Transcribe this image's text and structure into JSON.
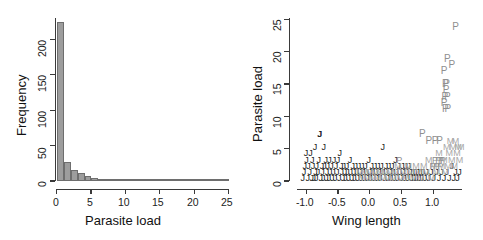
{
  "figure": {
    "title": "",
    "panels": [
      "histogram",
      "scatterplot"
    ]
  },
  "colors": {
    "bar_fill": "#9d9d9d",
    "bar_border": "#6e6e6e",
    "axis": "#3a3a3a",
    "text": "#111111",
    "group_J": "#1a1a1a",
    "group_M": "#a8a8a8",
    "group_P": "#8f8f8f"
  },
  "chart_data": [
    {
      "type": "bar",
      "id": "histogram",
      "title": "",
      "xlabel": "Parasite load",
      "ylabel": "Frequency",
      "xlim": [
        0,
        25
      ],
      "ylim": [
        0,
        230
      ],
      "xticks": [
        "0",
        "5",
        "10",
        "15",
        "20",
        "25"
      ],
      "xtick_values": [
        0,
        5,
        10,
        15,
        20,
        25
      ],
      "yticks": [
        "0",
        "50",
        "100",
        "150",
        "200"
      ],
      "ytick_values": [
        0,
        50,
        100,
        150,
        200
      ],
      "grid": false,
      "legend": "none",
      "bin_width": 1,
      "bin_starts": [
        0,
        1,
        2,
        3,
        4,
        5,
        6,
        7,
        8,
        9,
        10,
        11,
        12,
        13,
        14,
        15,
        16,
        17,
        18,
        19,
        20,
        21,
        22,
        23,
        24
      ],
      "categories": [
        "0-1",
        "1-2",
        "2-3",
        "3-4",
        "4-5",
        "5-6",
        "6-7",
        "7-8",
        "8-9",
        "9-10",
        "10-11",
        "11-12",
        "12-13",
        "13-14",
        "14-15",
        "15-16",
        "16-17",
        "17-18",
        "18-19",
        "19-20",
        "20-21",
        "21-22",
        "22-23",
        "23-24",
        "24-25"
      ],
      "values": [
        224,
        27,
        16,
        11,
        7,
        4,
        3,
        2,
        2,
        1,
        2,
        1,
        2,
        2,
        1,
        1,
        1,
        0,
        0,
        1,
        0,
        0,
        0,
        0,
        1
      ]
    },
    {
      "type": "scatter",
      "id": "scatterplot",
      "title": "",
      "xlabel": "Wing length",
      "ylabel": "Parasite load",
      "xlim": [
        -1.3,
        1.28
      ],
      "ylim": [
        -0.4,
        25.5
      ],
      "xticks": [
        "-1.0",
        "-0.5",
        "0.0",
        "0.5",
        "1.0"
      ],
      "xtick_values": [
        -1.0,
        -0.5,
        0.0,
        0.5,
        1.0
      ],
      "yticks": [
        "0",
        "5",
        "10",
        "15",
        "20",
        "25"
      ],
      "ytick_values": [
        0,
        5,
        10,
        15,
        20,
        25
      ],
      "grid": false,
      "legend": "none",
      "marker_type": "text-letter",
      "series": [
        {
          "name": "J",
          "label": "J",
          "color": "#1a1a1a",
          "points": [
            [
              -1.21,
              0
            ],
            [
              -1.19,
              1
            ],
            [
              -1.18,
              2
            ],
            [
              -1.16,
              4
            ],
            [
              -1.15,
              3
            ],
            [
              -1.13,
              0
            ],
            [
              -1.12,
              2
            ],
            [
              -1.1,
              1
            ],
            [
              -1.09,
              4
            ],
            [
              -1.07,
              0
            ],
            [
              -1.06,
              3
            ],
            [
              -1.05,
              2
            ],
            [
              -1.04,
              0
            ],
            [
              -1.02,
              5
            ],
            [
              -1.01,
              1
            ],
            [
              -1.0,
              0
            ],
            [
              -0.99,
              2
            ],
            [
              -0.97,
              1
            ],
            [
              -0.96,
              3
            ],
            [
              -0.95,
              7
            ],
            [
              -0.94,
              7
            ],
            [
              -0.93,
              0
            ],
            [
              -0.91,
              2
            ],
            [
              -0.9,
              1
            ],
            [
              -0.89,
              0
            ],
            [
              -0.88,
              5
            ],
            [
              -0.87,
              2
            ],
            [
              -0.85,
              3
            ],
            [
              -0.84,
              0
            ],
            [
              -0.83,
              1
            ],
            [
              -0.82,
              2
            ],
            [
              -0.8,
              0
            ],
            [
              -0.79,
              3
            ],
            [
              -0.78,
              1
            ],
            [
              -0.76,
              2
            ],
            [
              -0.75,
              0
            ],
            [
              -0.73,
              1
            ],
            [
              -0.72,
              3
            ],
            [
              -0.7,
              0
            ],
            [
              -0.69,
              2
            ],
            [
              -0.67,
              1
            ],
            [
              -0.66,
              3
            ],
            [
              -0.64,
              0
            ],
            [
              -0.63,
              4
            ],
            [
              -0.61,
              2
            ],
            [
              -0.6,
              1
            ],
            [
              -0.58,
              0
            ],
            [
              -0.57,
              2
            ],
            [
              -0.55,
              1
            ],
            [
              -0.54,
              0
            ],
            [
              -0.52,
              2
            ],
            [
              -0.51,
              1
            ],
            [
              -0.49,
              0
            ],
            [
              -0.47,
              3
            ],
            [
              -0.46,
              1
            ],
            [
              -0.44,
              0
            ],
            [
              -0.43,
              2
            ],
            [
              -0.41,
              1
            ],
            [
              -0.4,
              0
            ],
            [
              -0.38,
              2
            ],
            [
              -0.36,
              1
            ],
            [
              -0.35,
              0
            ],
            [
              -0.33,
              2
            ],
            [
              -0.31,
              1
            ],
            [
              -0.3,
              0
            ],
            [
              -0.28,
              2
            ],
            [
              -0.26,
              1
            ],
            [
              -0.25,
              0
            ],
            [
              -0.23,
              2
            ],
            [
              -0.21,
              1
            ],
            [
              -0.2,
              0
            ],
            [
              -0.18,
              3
            ],
            [
              -0.16,
              1
            ],
            [
              -0.15,
              0
            ],
            [
              -0.13,
              2
            ],
            [
              -0.11,
              1
            ],
            [
              -0.1,
              0
            ],
            [
              -0.08,
              2
            ],
            [
              -0.06,
              1
            ],
            [
              -0.05,
              0
            ],
            [
              -0.03,
              2
            ],
            [
              -0.01,
              1
            ],
            [
              0.0,
              0
            ],
            [
              0.02,
              2
            ],
            [
              0.04,
              5
            ],
            [
              0.05,
              1
            ],
            [
              0.07,
              0
            ],
            [
              0.09,
              2
            ],
            [
              0.1,
              1
            ],
            [
              0.12,
              0
            ],
            [
              0.14,
              2
            ],
            [
              0.16,
              1
            ],
            [
              0.17,
              0
            ],
            [
              0.19,
              2
            ],
            [
              0.21,
              1
            ],
            [
              0.22,
              0
            ],
            [
              0.24,
              3
            ],
            [
              0.26,
              1
            ],
            [
              0.27,
              0
            ],
            [
              0.29,
              2
            ],
            [
              0.31,
              1
            ],
            [
              0.33,
              0
            ],
            [
              0.35,
              2
            ],
            [
              0.36,
              1
            ],
            [
              0.38,
              0
            ],
            [
              0.4,
              2
            ],
            [
              0.42,
              1
            ],
            [
              0.43,
              0
            ],
            [
              0.45,
              2
            ],
            [
              0.47,
              1
            ],
            [
              0.49,
              0
            ],
            [
              0.51,
              1
            ],
            [
              0.53,
              0
            ],
            [
              0.55,
              1
            ],
            [
              0.57,
              0
            ],
            [
              0.59,
              1
            ],
            [
              0.61,
              0
            ],
            [
              0.63,
              1
            ],
            [
              0.65,
              0
            ],
            [
              0.67,
              1
            ],
            [
              0.7,
              0
            ],
            [
              0.73,
              1
            ],
            [
              0.76,
              0
            ],
            [
              0.8,
              1
            ],
            [
              0.84,
              0
            ],
            [
              0.88,
              1
            ],
            [
              0.92,
              0
            ],
            [
              0.96,
              1
            ],
            [
              1.0,
              0
            ],
            [
              1.04,
              1
            ],
            [
              1.08,
              0
            ],
            [
              1.12,
              2
            ],
            [
              1.15,
              0
            ],
            [
              1.18,
              1
            ],
            [
              1.21,
              0
            ],
            [
              1.24,
              1
            ]
          ]
        },
        {
          "name": "M",
          "label": "M",
          "color": "#a8a8a8",
          "points": [
            [
              -0.32,
              1
            ],
            [
              -0.28,
              0
            ],
            [
              -0.24,
              1
            ],
            [
              -0.2,
              0
            ],
            [
              -0.16,
              1
            ],
            [
              -0.12,
              0
            ],
            [
              -0.08,
              1
            ],
            [
              -0.04,
              0
            ],
            [
              0.0,
              1
            ],
            [
              0.04,
              0
            ],
            [
              0.08,
              1
            ],
            [
              0.12,
              0
            ],
            [
              0.16,
              1
            ],
            [
              0.2,
              0
            ],
            [
              0.24,
              1
            ],
            [
              0.28,
              2
            ],
            [
              0.32,
              0
            ],
            [
              0.36,
              1
            ],
            [
              0.4,
              0
            ],
            [
              0.44,
              2
            ],
            [
              0.48,
              1
            ],
            [
              0.52,
              0
            ],
            [
              0.56,
              2
            ],
            [
              0.6,
              1
            ],
            [
              0.64,
              0
            ],
            [
              0.68,
              2
            ],
            [
              0.72,
              1
            ],
            [
              0.76,
              3
            ],
            [
              0.8,
              0
            ],
            [
              0.84,
              2
            ],
            [
              0.88,
              1
            ],
            [
              0.92,
              4
            ],
            [
              0.96,
              2
            ],
            [
              1.0,
              3
            ],
            [
              1.02,
              1
            ],
            [
              1.04,
              5
            ],
            [
              1.06,
              2
            ],
            [
              1.08,
              4
            ],
            [
              1.1,
              6
            ],
            [
              1.12,
              3
            ],
            [
              1.14,
              5
            ],
            [
              1.16,
              2
            ],
            [
              1.18,
              6
            ],
            [
              1.2,
              4
            ],
            [
              1.22,
              5
            ],
            [
              1.24,
              3
            ],
            [
              1.26,
              5
            ]
          ]
        },
        {
          "name": "P",
          "label": "P",
          "color": "#8f8f8f",
          "points": [
            [
              1.18,
              24
            ],
            [
              1.05,
              19
            ],
            [
              1.12,
              18
            ],
            [
              1.0,
              17
            ],
            [
              1.02,
              15
            ],
            [
              1.04,
              15
            ],
            [
              1.03,
              14
            ],
            [
              1.01,
              13
            ],
            [
              1.05,
              13
            ],
            [
              1.0,
              12
            ],
            [
              1.02,
              11
            ],
            [
              1.06,
              11
            ],
            [
              0.66,
              7
            ],
            [
              0.76,
              6
            ],
            [
              0.86,
              6
            ],
            [
              0.93,
              6
            ],
            [
              0.86,
              3
            ],
            [
              0.91,
              3
            ],
            [
              0.95,
              3
            ],
            [
              0.98,
              3
            ],
            [
              0.3,
              3
            ],
            [
              0.82,
              2
            ],
            [
              0.88,
              2
            ],
            [
              0.94,
              2
            ]
          ]
        }
      ]
    }
  ]
}
